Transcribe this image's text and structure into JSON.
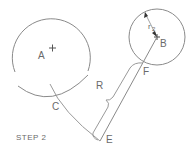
{
  "diagram": {
    "title": "STEP 2",
    "labels": {
      "A": "A",
      "B": "B",
      "C": "C",
      "E": "E",
      "F": "F",
      "R": "R",
      "r2": "r",
      "r2_sub": "2"
    },
    "colors": {
      "line": "#8a8a8a",
      "text": "#6a6a6a",
      "background": "#ffffff"
    }
  }
}
